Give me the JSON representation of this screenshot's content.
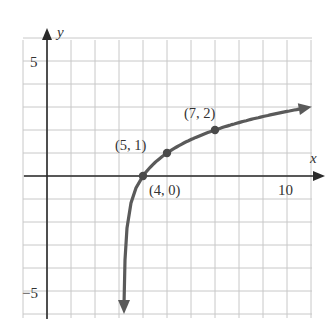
{
  "chart_data": {
    "type": "line",
    "title": "",
    "function": "y = log2(x - 3)",
    "xlabel": "x",
    "ylabel": "y",
    "xlim": [
      -1,
      11
    ],
    "ylim": [
      -6,
      6
    ],
    "grid": true,
    "x_ticks_labeled": [
      {
        "value": 10,
        "label": "10"
      }
    ],
    "y_ticks_labeled": [
      {
        "value": 5,
        "label": "5"
      },
      {
        "value": -5,
        "label": "−5"
      }
    ],
    "vertical_asymptote": 3,
    "series": [
      {
        "name": "curve",
        "points": [
          {
            "x": 4,
            "y": 0,
            "label": "(4, 0)"
          },
          {
            "x": 5,
            "y": 1,
            "label": "(5, 1)"
          },
          {
            "x": 7,
            "y": 2,
            "label": "(7, 2)"
          }
        ]
      }
    ],
    "colors": {
      "curve": "#5a5a5a",
      "axis": "#2a2a2a",
      "grid": "#c8c8c8"
    }
  },
  "labels": {
    "x_axis": "x",
    "y_axis": "y",
    "tick_x10": "10",
    "tick_y5": "5",
    "tick_ym5": "−5",
    "pt_4_0": "(4, 0)",
    "pt_5_1": "(5, 1)",
    "pt_7_2": "(7, 2)"
  }
}
